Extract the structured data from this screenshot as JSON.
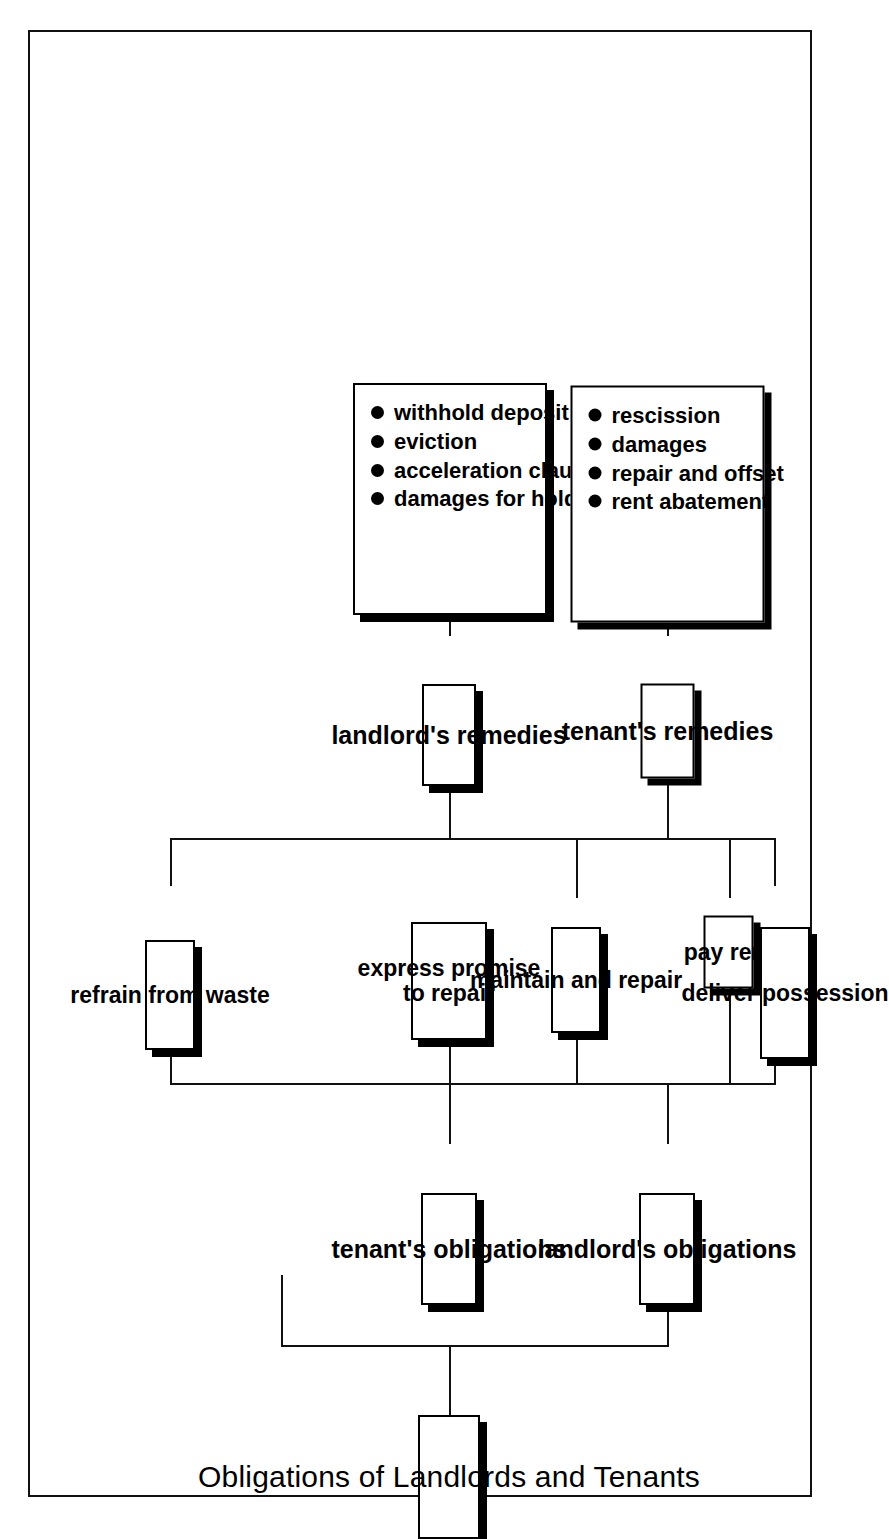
{
  "diagram": {
    "type": "hierarchical-tree",
    "orientation": "rotated-90-ccw",
    "title": "Obligations of Landlords and Tenants",
    "branches": [
      {
        "id": "landlord",
        "heading": "landlord's obligations",
        "duties": [
          "deliver possession",
          "maintain and repair"
        ],
        "remedies_heading": "tenant's remedies",
        "remedies": [
          "rescission",
          "damages",
          "repair and offset",
          "rent abatement"
        ]
      },
      {
        "id": "tenant",
        "heading": "tenant's obligations",
        "duties": [
          "pay rent",
          "express promise to repair",
          "refrain from waste"
        ],
        "remedies_heading": "landlord's remedies",
        "remedies": [
          "withhold deposit",
          "eviction",
          "acceleration clause",
          "damages for holdover"
        ]
      }
    ],
    "colors": {
      "line": "#111111",
      "box_border": "#000000",
      "box_fill": "#ffffff",
      "shadow": "#000000",
      "text": "#000000",
      "page_background": "#ffffff"
    },
    "labels": {
      "root": "Obligations of Landlords and Tenants",
      "landlord_obligations": "landlord's obligations",
      "tenant_obligations": "tenant's obligations",
      "deliver_possession": "deliver possession",
      "maintain_and_repair": "maintain and repair",
      "pay_rent": "pay rent",
      "express_promise_to_repair": "express promise\nto repair",
      "express_promise_line1": "express promise",
      "express_promise_line2": "to repair",
      "refrain_from_waste": "refrain from waste",
      "tenants_remedies": "tenant's remedies",
      "landlords_remedies": "landlord's remedies",
      "rescission": "rescission",
      "damages": "damages",
      "repair_and_offset": "repair and offset",
      "rent_abatement": "rent abatement",
      "withhold_deposit": "withhold deposit",
      "eviction": "eviction",
      "acceleration_clause": "acceleration clause",
      "damages_for_holdover": "damages for holdover"
    }
  }
}
